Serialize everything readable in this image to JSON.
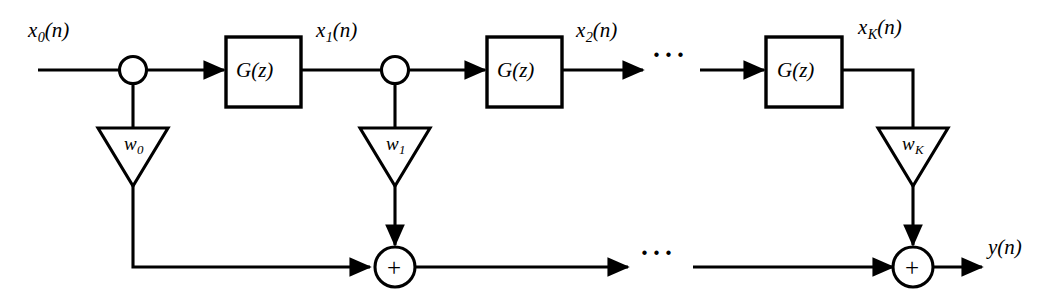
{
  "diagram": {
    "stroke_color": "#000000",
    "background_color": "#ffffff"
  },
  "signals": {
    "x0": {
      "base": "x",
      "sub": "0",
      "arg": "(n)"
    },
    "x1": {
      "base": "x",
      "sub": "1",
      "arg": "(n)"
    },
    "x2": {
      "base": "x",
      "sub": "2",
      "arg": "(n)"
    },
    "xK": {
      "base": "x",
      "sub": "K",
      "arg": "(n)"
    },
    "y": {
      "base": "y",
      "sub": "",
      "arg": "(n)"
    }
  },
  "blocks": {
    "g1": {
      "label": "G(z)"
    },
    "g2": {
      "label": "G(z)"
    },
    "g3": {
      "label": "G(z)"
    }
  },
  "weights": {
    "w0": {
      "base": "w",
      "sub": "0"
    },
    "w1": {
      "base": "w",
      "sub": "1"
    },
    "wK": {
      "base": "w",
      "sub": "K"
    }
  },
  "adders": {
    "sum1": {
      "operator": "+"
    },
    "sum2": {
      "operator": "+"
    }
  },
  "ellipses": {
    "top": "···",
    "bottom": "···"
  }
}
